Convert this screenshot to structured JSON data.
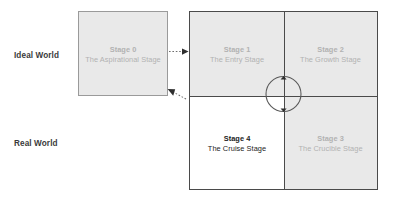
{
  "diagram": {
    "axis_labels": {
      "ideal_world": "Ideal World",
      "real_world": "Real World"
    },
    "stages": {
      "stage0": {
        "title": "Stage 0",
        "subtitle": "The Aspirational Stage"
      },
      "stage1": {
        "title": "Stage 1",
        "subtitle": "The Entry Stage"
      },
      "stage2": {
        "title": "Stage 2",
        "subtitle": "The Growth Stage"
      },
      "stage3": {
        "title": "Stage 3",
        "subtitle": "The Crucible Stage"
      },
      "stage4": {
        "title": "Stage 4",
        "subtitle": "The Cruise Stage"
      }
    },
    "colors": {
      "shaded_fill": "#e9e9e9",
      "highlight_fill": "#ffffff",
      "muted_text": "#b2b2b2",
      "emphasis_text": "#1c1c1c",
      "border": "#4a4a4a",
      "stage0_border": "#9a9a9a",
      "label_text": "#3a3a3a",
      "connector": "#6e6e6e"
    }
  }
}
